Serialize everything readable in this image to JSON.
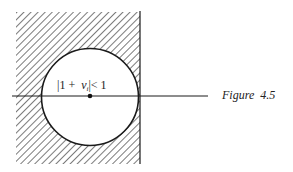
{
  "figure": {
    "caption": "Figure  4.5",
    "region_label_prefix": "|1 +  ",
    "region_label_var": "v",
    "region_label_sub": "i",
    "region_label_suffix": "|< 1",
    "colors": {
      "ink": "#1a1a1a",
      "hatch": "#333333",
      "background": "#ffffff"
    }
  }
}
